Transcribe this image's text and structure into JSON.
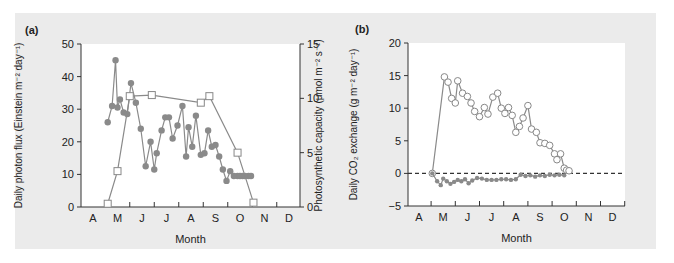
{
  "colors": {
    "panel_bg": "#ebebeb",
    "plot_bg": "#ffffff",
    "axis": "#333333",
    "series_line": "#8a8a8a",
    "filled_marker": "#8a8a8a",
    "open_marker_fill": "#ffffff"
  },
  "chart_data": [
    {
      "panel_label": "(a)",
      "type": "line",
      "xlabel": "Month",
      "ylabel_left": "Daily photon flux (Einstein m⁻² day⁻¹)",
      "ylabel_right": "Photosynthetic capacity (μmol  m⁻² s⁻¹)",
      "x_ticks": [
        "A",
        "M",
        "J",
        "J",
        "A",
        "S",
        "O",
        "N",
        "D"
      ],
      "ylim_left": [
        0,
        50
      ],
      "yticks_left": [
        0,
        10,
        20,
        30,
        40,
        50
      ],
      "ylim_right": [
        0,
        15
      ],
      "yticks_right": [
        0,
        5,
        10,
        15
      ],
      "grid": false,
      "series": [
        {
          "name": "Daily photon flux",
          "axis": "left",
          "marker": "filled-circle",
          "x_month_index": [
            0.6,
            0.78,
            0.92,
            1.0,
            1.1,
            1.25,
            1.4,
            1.55,
            1.75,
            1.95,
            2.15,
            2.35,
            2.5,
            2.6,
            2.8,
            2.95,
            3.1,
            3.25,
            3.45,
            3.65,
            3.8,
            3.9,
            4.05,
            4.2,
            4.4,
            4.55,
            4.7,
            4.85,
            5.0,
            5.15,
            5.3,
            5.45,
            5.6,
            5.75,
            5.9,
            6.0,
            6.1,
            6.2,
            6.35,
            6.45
          ],
          "values": [
            26,
            31,
            45,
            30.5,
            33,
            29,
            28.5,
            38,
            32,
            24,
            12.5,
            20,
            11.5,
            16.5,
            23.5,
            27.5,
            27.5,
            21,
            25,
            31,
            15.5,
            24.5,
            18.5,
            28,
            16,
            16.5,
            23.5,
            18.5,
            19,
            15.5,
            11.5,
            8,
            11,
            9.5,
            9.5,
            9.5,
            9.5,
            9.5,
            9.5,
            9.5
          ]
        },
        {
          "name": "Photosynthetic capacity",
          "axis": "right",
          "marker": "open-square",
          "x_month_index": [
            0.6,
            1.0,
            1.5,
            2.4,
            4.4,
            4.75,
            5.9,
            6.55
          ],
          "values": [
            0.3,
            3.3,
            10.2,
            10.3,
            9.6,
            10.2,
            5.0,
            0.4
          ]
        }
      ]
    },
    {
      "panel_label": "(b)",
      "type": "line",
      "xlabel": "Month",
      "ylabel": "Daily CO₂ exchange (g m⁻² day⁻¹)",
      "x_ticks": [
        "A",
        "M",
        "J",
        "J",
        "A",
        "S",
        "O",
        "N",
        "D"
      ],
      "ylim": [
        -5,
        20
      ],
      "yticks": [
        -5,
        0,
        5,
        10,
        15,
        20
      ],
      "reference_line": {
        "y": 0,
        "style": "dashed"
      },
      "grid": false,
      "series": [
        {
          "name": "Net CO2 uptake (open circles)",
          "marker": "open-circle",
          "x_month_index": [
            0.55,
            1.05,
            1.2,
            1.35,
            1.5,
            1.6,
            1.8,
            2.0,
            2.15,
            2.3,
            2.5,
            2.7,
            2.85,
            3.05,
            3.25,
            3.4,
            3.55,
            3.7,
            3.85,
            4.0,
            4.15,
            4.3,
            4.5,
            4.65,
            4.85,
            5.0,
            5.2,
            5.4,
            5.6,
            5.7,
            5.85,
            6.0,
            6.1,
            6.2
          ],
          "values": [
            0,
            14.8,
            14,
            11.5,
            10.8,
            14.2,
            12.3,
            11.8,
            10.8,
            9.5,
            8.7,
            10.1,
            9.1,
            11.7,
            12.3,
            10.0,
            9.2,
            10.1,
            8.9,
            6.3,
            7.2,
            8.5,
            10.4,
            6.8,
            6.3,
            4.7,
            4.6,
            4.3,
            3.0,
            2.1,
            3.0,
            0.8,
            0.5,
            0.4
          ]
        },
        {
          "name": "Respiration (filled circles)",
          "marker": "filled-circle",
          "x_month_index": [
            0.55,
            0.75,
            0.9,
            1.0,
            1.15,
            1.3,
            1.45,
            1.6,
            1.75,
            1.9,
            2.05,
            2.2,
            2.4,
            2.6,
            2.8,
            3.0,
            3.2,
            3.4,
            3.6,
            3.8,
            4.0,
            4.2,
            4.4,
            4.6,
            4.8,
            5.0,
            5.2,
            5.4,
            5.6,
            5.8,
            6.0
          ],
          "values": [
            0,
            -1.2,
            -1.8,
            -0.8,
            -1.2,
            -1.6,
            -1.3,
            -1.0,
            -1.2,
            -0.9,
            -1.5,
            -1.1,
            -0.7,
            -0.8,
            -1.0,
            -1.0,
            -1.0,
            -0.9,
            -0.9,
            -1.0,
            -0.9,
            -0.2,
            -0.4,
            -0.3,
            -0.5,
            -0.3,
            -0.4,
            -0.2,
            -0.3,
            -0.2,
            -0.3
          ]
        }
      ]
    }
  ]
}
